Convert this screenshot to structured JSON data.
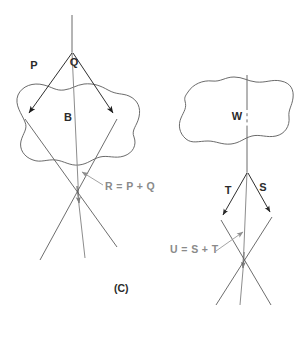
{
  "figure": {
    "panel_label": "(C)",
    "background_color": "#ffffff",
    "stroke_color": "#4a4a4a",
    "label_color": "#2b2b2b",
    "annotation_color": "#8a8a8a"
  },
  "left_diagram": {
    "name": "two-force-resultant-diagram",
    "body_label": "B",
    "force_labels": {
      "p": "P",
      "q": "Q"
    },
    "resultant_annotation": "R = P + Q"
  },
  "right_diagram": {
    "name": "two-force-resultant-diagram-w",
    "body_label": "W",
    "force_labels": {
      "t": "T",
      "s": "S"
    },
    "resultant_annotation": "U = S + T"
  }
}
